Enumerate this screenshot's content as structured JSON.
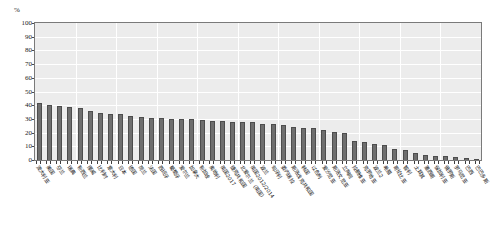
{
  "chart_data": {
    "type": "bar",
    "title": "",
    "subtitle": "",
    "xlabel": "",
    "ylabel": "%",
    "unit_label": "%",
    "ylim": [
      0,
      100
    ],
    "ytick_values": [
      0,
      10,
      20,
      30,
      40,
      50,
      60,
      70,
      80,
      90,
      100
    ],
    "ytick_labels": [
      "0",
      "10",
      "20",
      "30",
      "40",
      "50",
      "60",
      "70",
      "80",
      "90",
      "100"
    ],
    "grid": true,
    "legend": "none",
    "bar_color": "#6e6e6e",
    "bar_edge_color": "#4d4d4d",
    "plot_background": "#ececec",
    "gridline_color": "#ffffff",
    "axis_color": "#7a7a7a",
    "orientation": "vertical",
    "label_rotation_deg": 55,
    "categories": [
      "澳大利亚",
      "美国",
      "芬兰",
      "瑞典",
      "新西兰",
      "挪威",
      "比利时",
      "意大利",
      "日本",
      "德国",
      "荷兰",
      "法国",
      "西班牙",
      "葡萄牙",
      "爱尔兰",
      "加拿大",
      "新加坡",
      "奥地利",
      "英国2017",
      "捷克共和国",
      "北爱尔兰（英国）",
      "英国2012/2014",
      "波兰",
      "匈牙利",
      "委内瑞拉",
      "斯洛伐克共和国",
      "韩国",
      "以色列",
      "爱沙尼亚",
      "斯洛文尼亚",
      "立陶宛",
      "拉脱维亚",
      "克罗地亚",
      "波兰2",
      "希腊",
      "哥伦比亚",
      "智利",
      "土耳其",
      "墨西哥",
      "保加利亚",
      "俄罗斯",
      "罗马尼亚",
      "巴西",
      "巴巴多斯"
    ],
    "values": [
      41.5,
      40.3,
      39.5,
      38.9,
      38.2,
      36.0,
      34.5,
      33.8,
      33.6,
      31.9,
      31.4,
      31.0,
      30.5,
      30.2,
      29.7,
      29.6,
      29.0,
      28.6,
      28.4,
      28.1,
      27.9,
      27.4,
      26.6,
      26.0,
      25.2,
      23.8,
      23.5,
      23.3,
      21.9,
      20.6,
      19.4,
      13.6,
      13.2,
      11.6,
      11.0,
      7.9,
      7.1,
      5.4,
      3.6,
      3.0,
      2.6,
      2.0,
      1.4,
      0.7
    ]
  }
}
